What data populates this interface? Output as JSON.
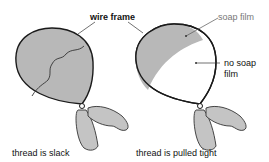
{
  "labels": {
    "wire_frame": "wire frame",
    "soap_film": "soap film",
    "no_soap_film_line1": "no soap",
    "no_soap_film_line2": "film",
    "left_caption": "thread is slack",
    "right_caption": "thread is pulled tight"
  },
  "colors": {
    "film": "#b8b8b8",
    "outline": "#1a1a1a",
    "background": "#ffffff"
  }
}
